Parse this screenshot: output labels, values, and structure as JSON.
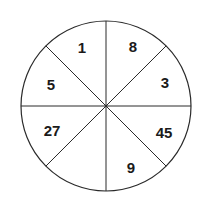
{
  "diagram": {
    "type": "sectored-circle",
    "sectors": 8,
    "center": [
      106,
      106
    ],
    "radius": 85,
    "line_color": "#2a2a2a",
    "labels": [
      {
        "sector": "top-left",
        "value": "1",
        "x": 82,
        "y": 47
      },
      {
        "sector": "top-right",
        "value": "8",
        "x": 133,
        "y": 46
      },
      {
        "sector": "right-upper",
        "value": "3",
        "x": 165,
        "y": 82
      },
      {
        "sector": "right-lower",
        "value": "45",
        "x": 164,
        "y": 132
      },
      {
        "sector": "bottom-right",
        "value": "9",
        "x": 131,
        "y": 167
      },
      {
        "sector": "bottom-left",
        "value": "",
        "x": 82,
        "y": 167
      },
      {
        "sector": "left-lower",
        "value": "27",
        "x": 52,
        "y": 130
      },
      {
        "sector": "left-upper",
        "value": "5",
        "x": 51,
        "y": 84
      }
    ]
  }
}
